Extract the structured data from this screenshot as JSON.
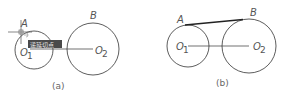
{
  "figure_a": {
    "caption": "(a)",
    "point_a_label": "A",
    "point_b_label": "B",
    "center1_label": "O",
    "center1_sub": "1",
    "center2_label": "O",
    "center2_sub": "2",
    "snap_tooltip": "递延切点"
  },
  "figure_b": {
    "caption": "(b)",
    "point_a_label": "A",
    "point_b_label": "B",
    "center1_label": "O",
    "center1_sub": "1",
    "center2_label": "O",
    "center2_sub": "2"
  },
  "colors": {
    "line": "#333333",
    "tooltip_bg": "#4a4a4a",
    "text": "#555555"
  }
}
